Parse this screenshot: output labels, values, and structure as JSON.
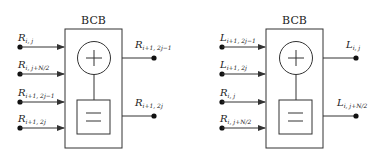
{
  "diagram": {
    "colors": {
      "stroke": "#333333",
      "text": "#222222",
      "background": "#ffffff"
    },
    "blocks": [
      {
        "title": "BCB",
        "inputs": [
          {
            "main": "R",
            "sub": "i, j"
          },
          {
            "main": "R",
            "sub": "i, j+N/2"
          },
          {
            "main": "R",
            "sub": "i+1, 2j−1"
          },
          {
            "main": "R",
            "sub": "i+1, 2j"
          }
        ],
        "outputs": [
          {
            "main": "R",
            "sub": "i+1, 2j−1"
          },
          {
            "main": "R",
            "sub": "i+1, 2j"
          }
        ],
        "operators": {
          "top": "+",
          "bottom": "="
        }
      },
      {
        "title": "BCB",
        "inputs": [
          {
            "main": "L",
            "sub": "i+1, 2j−1"
          },
          {
            "main": "L",
            "sub": "i+1, 2j"
          },
          {
            "main": "R",
            "sub": "i, j"
          },
          {
            "main": "R",
            "sub": "i, j+N/2"
          }
        ],
        "outputs": [
          {
            "main": "L",
            "sub": "i, j"
          },
          {
            "main": "L",
            "sub": "i, j+N/2"
          }
        ],
        "operators": {
          "top": "+",
          "bottom": "="
        }
      }
    ]
  }
}
